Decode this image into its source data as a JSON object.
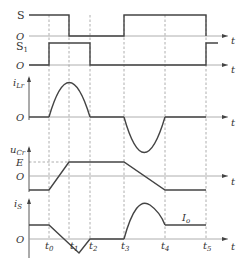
{
  "diagram": {
    "type": "timing-waveforms",
    "colors": {
      "trace": "#333333",
      "axis": "#888888",
      "dashed": "#999999",
      "background": "#ffffff"
    },
    "time_markers": [
      "t0",
      "t1",
      "t2",
      "t3",
      "t4",
      "t5"
    ],
    "time_marker_labels": {
      "t0": "t",
      "t0sub": "0",
      "t1": "t",
      "t1sub": "1",
      "t2": "t",
      "t2sub": "2",
      "t3": "t",
      "t3sub": "3",
      "t4": "t",
      "t4sub": "4",
      "t5": "t",
      "t5sub": "5"
    },
    "axis_t_label": "t",
    "origin_label": "O",
    "traces": {
      "S": {
        "label": "S",
        "states": "high until t1, low t1–t3, high t3–t5, low after t5"
      },
      "S1": {
        "label": "S",
        "label_sub": "1",
        "states": "low until t0, high t0–t2, low t2–t5, high after t5"
      },
      "iLr": {
        "label": "i",
        "label_sub": "Lr",
        "shape": "positive half-sine t0–t2 (peak at t1), negative half-sine t3–t4"
      },
      "uCr": {
        "label": "u",
        "label_sub": "Cr",
        "level_label": "E",
        "shape": "negative constant until t0, linear rise to E at t1, constant E until t3, linear fall to negative level at t4, constant to t5"
      },
      "iS": {
        "label": "i",
        "label_sub": "S",
        "level_label": "I",
        "level_label_sub": "o",
        "shape": "Io until t0, linear fall crossing zero at t1, negative dip, back to zero at t2, zero until t3, hump rising after t3, settles to Io at t4, constant to t5"
      }
    }
  }
}
